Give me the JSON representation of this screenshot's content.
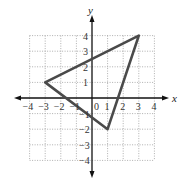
{
  "figure": {
    "x_axis_label": "x",
    "y_axis_label": "y",
    "origin_label": "0",
    "x_ticks": [
      "-4",
      "-3",
      "-2",
      "-1",
      "1",
      "2",
      "3",
      "4"
    ],
    "y_ticks": [
      "4",
      "3",
      "2",
      "1",
      "-1",
      "-2",
      "-3",
      "-4"
    ]
  },
  "colors": {
    "grid": "#9a9a9a",
    "axes": "#111111",
    "triangle": "#4a4a4a",
    "text": "#333333"
  },
  "diagram": {
    "type": "coordinate-plane-triangle",
    "x_range": [
      -4,
      4
    ],
    "y_range": [
      -4,
      4
    ],
    "grid": "dotted",
    "vertices": [
      {
        "x": -3,
        "y": 1
      },
      {
        "x": 3,
        "y": 4
      },
      {
        "x": 1,
        "y": -2
      }
    ]
  }
}
